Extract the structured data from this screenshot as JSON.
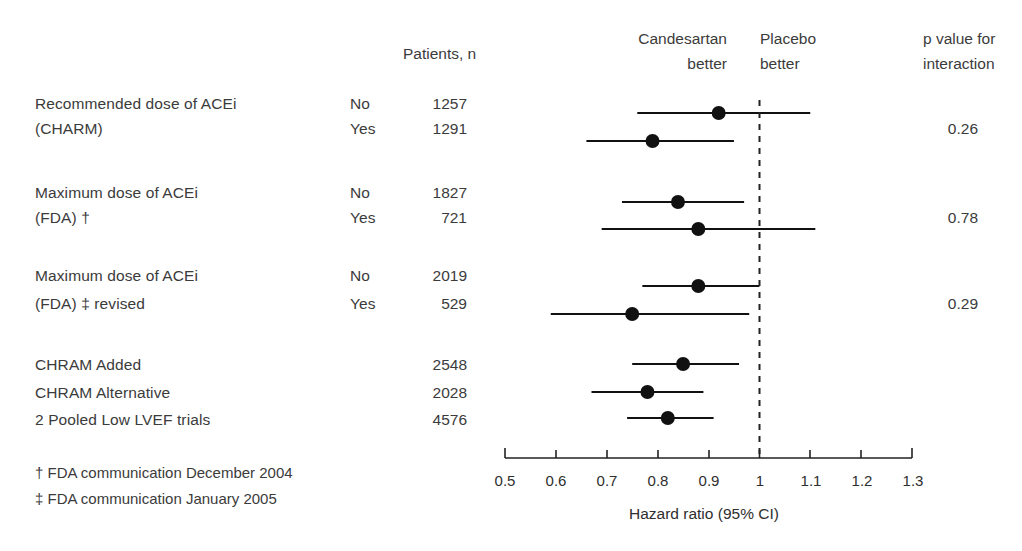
{
  "headers": {
    "patients": "Patients, n",
    "left_side_line1": "Candesartan",
    "left_side_line2": "better",
    "right_side_line1": "Placebo",
    "right_side_line2": "better",
    "pvalue_line1": "p value for",
    "pvalue_line2": "interaction"
  },
  "groups": [
    {
      "label_line1": "Recommended dose of ACEi",
      "label_line2": "(CHARM)",
      "p_value": "0.26",
      "rows": [
        {
          "strata": "No",
          "n": "1257"
        },
        {
          "strata": "Yes",
          "n": "1291"
        }
      ]
    },
    {
      "label_line1": "Maximum dose of ACEi",
      "label_line2": "(FDA) †",
      "p_value": "0.78",
      "rows": [
        {
          "strata": "No",
          "n": "1827"
        },
        {
          "strata": "Yes",
          "n": "721"
        }
      ]
    },
    {
      "label_line1": "Maximum dose of ACEi",
      "label_line2": "(FDA) ‡ revised",
      "p_value": "0.29",
      "rows": [
        {
          "strata": "No",
          "n": "2019"
        },
        {
          "strata": "Yes",
          "n": "529"
        }
      ]
    }
  ],
  "summary_rows": [
    {
      "label": "CHRAM Added",
      "n": "2548"
    },
    {
      "label": "CHRAM Alternative",
      "n": "2028"
    },
    {
      "label": "2 Pooled Low LVEF trials",
      "n": "4576"
    }
  ],
  "footnotes": [
    "† FDA communication December 2004",
    "‡ FDA communication January 2005"
  ],
  "axis": {
    "title": "Hazard ratio (95% CI)",
    "ticks": [
      "0.5",
      "0.6",
      "0.7",
      "0.8",
      "0.9",
      "1",
      "1.1",
      "1.2",
      "1.3"
    ]
  },
  "chart_data": {
    "type": "scatter",
    "title": "",
    "xlabel": "Hazard ratio (95% CI)",
    "ylabel": "",
    "xlim": [
      0.5,
      1.3
    ],
    "xticks": [
      0.5,
      0.6,
      0.7,
      0.8,
      0.9,
      1.0,
      1.1,
      1.2,
      1.3
    ],
    "xscale": "linear",
    "grid": false,
    "reference_line": 1.0,
    "reference_line_style": "dashed",
    "legend": "none",
    "annotations": {
      "left_of_reference": "Candesartan better",
      "right_of_reference": "Placebo better"
    },
    "points": [
      {
        "label": "Recommended dose of ACEi (CHARM) - No",
        "n": 1257,
        "hr": 0.92,
        "ci_low": 0.76,
        "ci_high": 1.1,
        "p_interaction": 0.26
      },
      {
        "label": "Recommended dose of ACEi (CHARM) - Yes",
        "n": 1291,
        "hr": 0.79,
        "ci_low": 0.66,
        "ci_high": 0.95,
        "p_interaction": 0.26
      },
      {
        "label": "Maximum dose of ACEi (FDA) † - No",
        "n": 1827,
        "hr": 0.84,
        "ci_low": 0.73,
        "ci_high": 0.97,
        "p_interaction": 0.78
      },
      {
        "label": "Maximum dose of ACEi (FDA) † - Yes",
        "n": 721,
        "hr": 0.88,
        "ci_low": 0.69,
        "ci_high": 1.11,
        "p_interaction": 0.78
      },
      {
        "label": "Maximum dose of ACEi (FDA) ‡ revised - No",
        "n": 2019,
        "hr": 0.88,
        "ci_low": 0.77,
        "ci_high": 1.0,
        "p_interaction": 0.29
      },
      {
        "label": "Maximum dose of ACEi (FDA) ‡ revised - Yes",
        "n": 529,
        "hr": 0.75,
        "ci_low": 0.59,
        "ci_high": 0.98,
        "p_interaction": 0.29
      },
      {
        "label": "CHRAM Added",
        "n": 2548,
        "hr": 0.85,
        "ci_low": 0.75,
        "ci_high": 0.96,
        "p_interaction": null
      },
      {
        "label": "CHRAM Alternative",
        "n": 2028,
        "hr": 0.78,
        "ci_low": 0.67,
        "ci_high": 0.89,
        "p_interaction": null
      },
      {
        "label": "2 Pooled Low LVEF trials",
        "n": 4576,
        "hr": 0.82,
        "ci_low": 0.74,
        "ci_high": 0.91,
        "p_interaction": null
      }
    ]
  }
}
